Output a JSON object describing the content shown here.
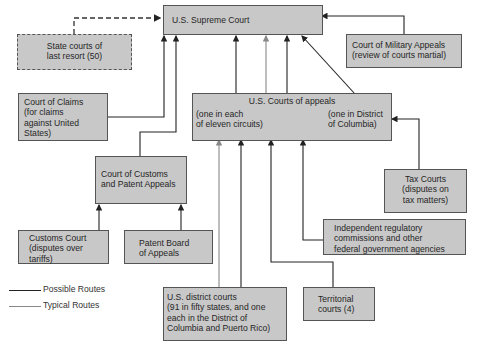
{
  "diagram": {
    "nodes": {
      "supreme": {
        "label": "U.S. Supreme Court"
      },
      "state": {
        "label": "State courts of last resort (50)",
        "lines": [
          "State courts of",
          "last resort (50)"
        ]
      },
      "military": {
        "lines": [
          "Court of Military Appeals",
          "(review of courts martial)"
        ]
      },
      "claims": {
        "lines": [
          "Court of Claims",
          "(for claims",
          "against United",
          "States)"
        ]
      },
      "appeals": {
        "title": "U.S. Courts of appeals",
        "left_lines": [
          "(one in each",
          "of eleven circuits)"
        ],
        "right_lines": [
          "(one in District",
          "of Columbia)"
        ]
      },
      "customs_patent": {
        "lines": [
          "Court of Customs",
          "and Patent Appeals"
        ]
      },
      "tax": {
        "lines": [
          "Tax Courts",
          "(disputes on",
          "tax matters)"
        ]
      },
      "agencies": {
        "lines": [
          "Independent regulatory",
          "commissions and other",
          "federal government agencies"
        ]
      },
      "customs_court": {
        "lines": [
          "Customs Court",
          "(disputes over",
          "tariffs)"
        ]
      },
      "patent_board": {
        "lines": [
          "Patent Board",
          "of Appeals"
        ]
      },
      "district": {
        "lines": [
          "U.S. district courts",
          "(91 in fifty states, and one",
          "each in the District of",
          "Columbia and Puerto Rico)"
        ]
      },
      "territorial": {
        "lines": [
          "Territorial",
          "courts (4)"
        ]
      }
    },
    "legend": {
      "possible": "Possible Routes",
      "typical": "Typical Routes"
    },
    "colors": {
      "box_fill": "#c8c8c8",
      "line": "#222222",
      "typical_line": "#888888"
    }
  }
}
